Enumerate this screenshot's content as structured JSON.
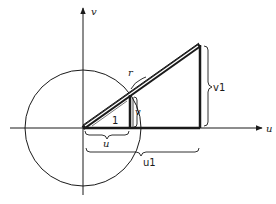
{
  "diagram": {
    "type": "geometric-construction",
    "axes": {
      "horizontal_label": "u",
      "vertical_label": "v"
    },
    "labels": {
      "hypotenuse_large": "r",
      "hypotenuse_small": "1",
      "small_vertical": "v",
      "small_horizontal": "u",
      "large_vertical": "v1",
      "large_horizontal": "u1"
    },
    "elements": [
      "unit circle centered at origin",
      "small right triangle inscribed to circle (hypotenuse 1, legs u, v)",
      "large similar right triangle (hypotenuse r, legs u1, v1)",
      "braces marking u, u1, v1, r"
    ],
    "colors": {
      "stroke": "#1a1a1a",
      "background": "#ffffff"
    }
  }
}
